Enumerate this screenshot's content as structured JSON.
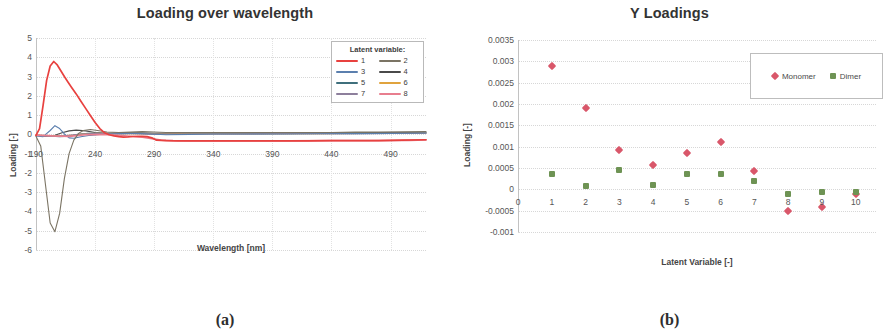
{
  "figure": {
    "panel_a_caption": "(a)",
    "panel_b_caption": "(b)"
  },
  "chart_data": [
    {
      "id": "loading-over-wavelength",
      "type": "line",
      "title": "Loading over wavelength",
      "xlabel": "Wavelength [nm]",
      "ylabel": "Loading [-]",
      "xlim": [
        190,
        520
      ],
      "ylim": [
        -6,
        5
      ],
      "grid": true,
      "legend_position": "top-right",
      "legend_title": "Latent variable:",
      "xticks": [
        190,
        240,
        290,
        340,
        390,
        440,
        490
      ],
      "yticks": [
        5,
        4,
        3,
        2,
        1,
        0,
        -1,
        -2,
        -3,
        -4,
        -5,
        -6
      ],
      "series": [
        {
          "name": "1",
          "color": "#e8413f",
          "x": [
            190,
            193,
            196,
            199,
            202,
            205,
            208,
            211,
            214,
            217,
            220,
            224,
            228,
            232,
            236,
            240,
            244,
            248,
            252,
            256,
            260,
            264,
            268,
            272,
            276,
            280,
            284,
            288,
            292,
            300,
            310,
            320,
            340,
            360,
            380,
            400,
            420,
            440,
            460,
            480,
            500,
            520
          ],
          "values": [
            -0.05,
            0.3,
            1.5,
            2.8,
            3.55,
            3.78,
            3.6,
            3.3,
            3.0,
            2.72,
            2.45,
            2.1,
            1.72,
            1.35,
            0.98,
            0.62,
            0.3,
            0.08,
            -0.02,
            -0.08,
            -0.12,
            -0.14,
            -0.13,
            -0.11,
            -0.1,
            -0.1,
            -0.12,
            -0.18,
            -0.3,
            -0.33,
            -0.34,
            -0.34,
            -0.34,
            -0.34,
            -0.34,
            -0.34,
            -0.34,
            -0.33,
            -0.33,
            -0.32,
            -0.3,
            -0.28
          ]
        },
        {
          "name": "2",
          "color": "#7b7464",
          "x": [
            190,
            194,
            198,
            202,
            206,
            210,
            214,
            218,
            222,
            226,
            230,
            236,
            242,
            250,
            260,
            270,
            280,
            290,
            300,
            320,
            340,
            360,
            380,
            400,
            420,
            440,
            460,
            480,
            500,
            520
          ],
          "values": [
            -0.1,
            -0.6,
            -2.6,
            -4.6,
            -5.05,
            -4.1,
            -2.3,
            -1.0,
            -0.3,
            0.05,
            0.2,
            0.25,
            0.2,
            0.12,
            0.1,
            0.12,
            0.14,
            0.12,
            0.1,
            0.1,
            0.1,
            0.1,
            0.1,
            0.1,
            0.1,
            0.1,
            0.12,
            0.12,
            0.13,
            0.15
          ]
        },
        {
          "name": "3",
          "color": "#5b7fae",
          "x": [
            190,
            196,
            202,
            206,
            210,
            214,
            218,
            222,
            228,
            236,
            244,
            252,
            262,
            274,
            286,
            300,
            320,
            340,
            370,
            400,
            430,
            460,
            490,
            520
          ],
          "values": [
            -0.08,
            -0.12,
            0.2,
            0.45,
            0.3,
            0.02,
            -0.18,
            -0.2,
            -0.12,
            -0.05,
            0.0,
            0.02,
            0.04,
            0.06,
            0.02,
            -0.02,
            0.0,
            0.02,
            0.02,
            0.02,
            0.03,
            0.04,
            0.05,
            0.07
          ]
        },
        {
          "name": "4",
          "color": "#4a4a4a",
          "x": [
            190,
            198,
            206,
            212,
            218,
            224,
            232,
            240,
            250,
            262,
            276,
            290,
            310,
            330,
            360,
            390,
            420,
            450,
            480,
            510,
            520
          ],
          "values": [
            -0.06,
            -0.1,
            -0.05,
            0.08,
            0.18,
            0.22,
            0.18,
            0.1,
            0.06,
            0.08,
            0.08,
            0.05,
            0.06,
            0.07,
            0.07,
            0.07,
            0.08,
            0.08,
            0.09,
            0.1,
            0.11
          ]
        },
        {
          "name": "5",
          "color": "#3f6f7c",
          "x": [
            190,
            200,
            210,
            218,
            226,
            234,
            244,
            256,
            270,
            286,
            304,
            326,
            352,
            382,
            414,
            446,
            478,
            510,
            520
          ],
          "values": [
            -0.04,
            -0.08,
            -0.12,
            -0.1,
            0.0,
            0.06,
            0.06,
            0.04,
            0.05,
            0.04,
            0.03,
            0.04,
            0.04,
            0.04,
            0.05,
            0.05,
            0.06,
            0.07,
            0.08
          ]
        },
        {
          "name": "6",
          "color": "#e0a33e",
          "x": [
            190,
            202,
            212,
            222,
            232,
            244,
            258,
            274,
            292,
            312,
            338,
            366,
            398,
            432,
            466,
            500,
            520
          ],
          "values": [
            -0.05,
            -0.06,
            -0.08,
            -0.04,
            0.04,
            0.05,
            0.04,
            0.05,
            0.02,
            0.03,
            0.03,
            0.03,
            0.04,
            0.04,
            0.05,
            0.06,
            0.07
          ]
        },
        {
          "name": "7",
          "color": "#8d7f9c",
          "x": [
            190,
            204,
            216,
            228,
            240,
            254,
            270,
            288,
            308,
            332,
            360,
            392,
            426,
            460,
            494,
            520
          ],
          "values": [
            -0.06,
            -0.1,
            -0.06,
            0.02,
            0.05,
            0.03,
            0.04,
            0.01,
            0.02,
            0.02,
            0.02,
            0.03,
            0.03,
            0.04,
            0.05,
            0.06
          ]
        },
        {
          "name": "8",
          "color": "#e87e8e",
          "x": [
            190,
            204,
            218,
            232,
            246,
            262,
            280,
            296,
            306,
            320,
            344,
            372,
            404,
            438,
            472,
            506,
            520
          ],
          "values": [
            -0.04,
            -0.08,
            -0.1,
            -0.02,
            0.0,
            -0.06,
            -0.15,
            -0.3,
            -0.33,
            -0.34,
            -0.34,
            -0.34,
            -0.34,
            -0.33,
            -0.33,
            -0.31,
            -0.29
          ]
        }
      ]
    },
    {
      "id": "y-loadings",
      "type": "scatter",
      "title": "Y Loadings",
      "xlabel": "Latent Variable [-]",
      "ylabel": "Loading [-]",
      "xlim": [
        0,
        10.6
      ],
      "ylim": [
        -0.001,
        0.0035
      ],
      "grid": true,
      "legend_position": "top-right",
      "xticks": [
        0,
        1,
        2,
        3,
        4,
        5,
        6,
        7,
        8,
        9,
        10
      ],
      "yticks": [
        0.0035,
        0.003,
        0.0025,
        0.002,
        0.0015,
        0.001,
        0.0005,
        0,
        -0.0005,
        -0.001
      ],
      "ytick_labels": [
        "0.0035",
        "0.003",
        "0.0025",
        "0.002",
        "0.0015",
        "0.001",
        "0.0005",
        "0",
        "-0.0005",
        "-0.001"
      ],
      "x": [
        1,
        2,
        3,
        4,
        5,
        6,
        7,
        8,
        9,
        10
      ],
      "series": [
        {
          "name": "Monomer",
          "color": "#d9576a",
          "marker": "diamond",
          "values": [
            0.00288,
            0.00191,
            0.00093,
            0.00058,
            0.00086,
            0.00111,
            0.00044,
            -0.0005,
            -0.00042,
            -0.00012
          ]
        },
        {
          "name": "Dimer",
          "color": "#6e9354",
          "marker": "square",
          "values": [
            0.00035,
            7e-05,
            0.00046,
            0.0001,
            0.00035,
            0.00036,
            0.0002,
            -0.00011,
            -7e-05,
            -7e-05
          ]
        }
      ]
    }
  ]
}
